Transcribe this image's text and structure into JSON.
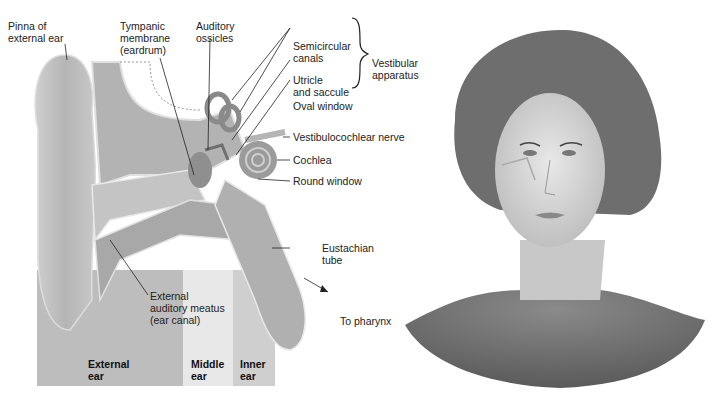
{
  "figure": {
    "left_panel": "Anatomy of the ear (cross-section)",
    "right_panel": "Illustration of woman's head showing ear position"
  },
  "labels": {
    "pinna": [
      "Pinna of",
      "external ear"
    ],
    "tympanic": [
      "Tympanic",
      "membrane",
      "(eardrum)"
    ],
    "ossicles": [
      "Auditory",
      "ossicles"
    ],
    "semicircular": [
      "Semicircular",
      "canals"
    ],
    "utricle": [
      "Utricle",
      "and saccule"
    ],
    "vestibular": [
      "Vestibular",
      "apparatus"
    ],
    "oval_window": "Oval window",
    "nerve": "Vestibulocochlear nerve",
    "cochlea": "Cochlea",
    "round_window": "Round window",
    "eustachian": [
      "Eustachian",
      "tube"
    ],
    "meatus": [
      "External",
      "auditory meatus",
      "(ear canal)"
    ],
    "pharynx": "To pharynx"
  },
  "zones": {
    "external": [
      "External",
      "ear"
    ],
    "middle": [
      "Middle",
      "ear"
    ],
    "inner": [
      "Inner",
      "ear"
    ]
  },
  "colors": {
    "zone_external": "#bdbdbd",
    "zone_middle": "#e6e6e6",
    "zone_inner": "#cfcfcf",
    "tissue": "#a8a8a8",
    "line": "#222222"
  }
}
